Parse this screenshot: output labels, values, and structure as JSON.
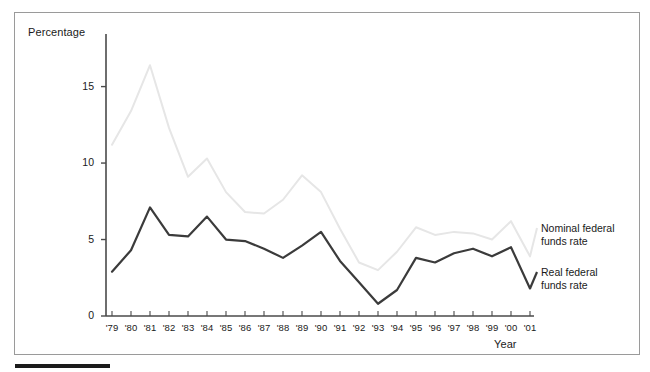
{
  "figure": {
    "ylabel": "Percentage",
    "xlabel": "Year"
  },
  "axes": {
    "y_ticks": [
      "0",
      "5",
      "10",
      "15"
    ],
    "x_ticks": [
      "'79",
      "'80",
      "'81",
      "'82",
      "'83",
      "'84",
      "'85",
      "'86",
      "'87",
      "'88",
      "'89",
      "'90",
      "'91",
      "'92",
      "'93",
      "'94",
      "'95",
      "'96",
      "'97",
      "'98",
      "'99",
      "'00",
      "'01"
    ]
  },
  "legend": {
    "nominal_line1": "Nominal federal",
    "nominal_line2": "funds rate",
    "real_line1": "Real federal",
    "real_line2": "funds rate"
  },
  "colors": {
    "nominal": "#e6e6e6",
    "real": "#3b3b3b",
    "axis": "#4a4a4a",
    "frame": "#9a9a9a",
    "footer_bar": "#1b1b1b"
  },
  "chart_data": {
    "type": "line",
    "title": "",
    "xlabel": "Year",
    "ylabel": "Percentage",
    "xlim": [
      "'79",
      "'01"
    ],
    "ylim": [
      0,
      17
    ],
    "yticks": [
      0,
      5,
      10,
      15
    ],
    "grid": false,
    "legend_position": "right-inline",
    "categories": [
      "'79",
      "'80",
      "'81",
      "'82",
      "'83",
      "'84",
      "'85",
      "'86",
      "'87",
      "'88",
      "'89",
      "'90",
      "'91",
      "'92",
      "'93",
      "'94",
      "'95",
      "'96",
      "'97",
      "'98",
      "'99",
      "'00",
      "'01"
    ],
    "series": [
      {
        "name": "Nominal federal funds rate",
        "color": "#e6e6e6",
        "values": [
          11.2,
          13.4,
          16.4,
          12.3,
          9.1,
          10.3,
          8.1,
          6.8,
          6.7,
          7.6,
          9.2,
          8.1,
          5.7,
          3.5,
          3.0,
          4.2,
          5.8,
          5.3,
          5.5,
          5.4,
          5.0,
          6.2,
          3.9
        ]
      },
      {
        "name": "Real federal funds rate",
        "color": "#3b3b3b",
        "values": [
          2.9,
          4.3,
          7.1,
          5.3,
          5.2,
          6.5,
          5.0,
          4.9,
          4.4,
          3.8,
          4.6,
          5.5,
          3.6,
          2.2,
          0.8,
          1.7,
          3.8,
          3.5,
          4.1,
          4.4,
          3.9,
          4.5,
          1.8
        ]
      }
    ]
  }
}
